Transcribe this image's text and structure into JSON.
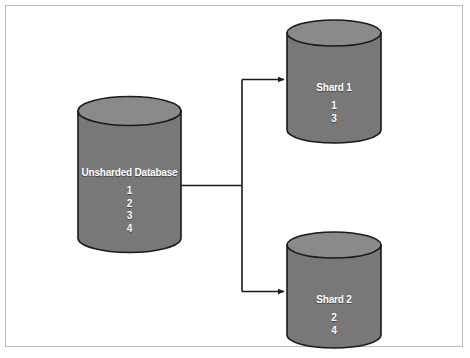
{
  "figure": {
    "kind": "database-sharding-diagram",
    "background_color": "#ffffff",
    "frame_color": "#b9b9b9",
    "cylinder_top_color": "#8a8a8a",
    "cylinder_body_color": "#787878",
    "cylinder_outline_color": "#1a1a1a",
    "connector_color": "#1a1a1a",
    "label_color": "#ffffff"
  },
  "source": {
    "title": "Unsharded Database",
    "items": [
      "1",
      "2",
      "3",
      "4"
    ]
  },
  "shards": [
    {
      "title": "Shard 1",
      "items": [
        "1",
        "3"
      ]
    },
    {
      "title": "Shard 2",
      "items": [
        "2",
        "4"
      ]
    }
  ]
}
